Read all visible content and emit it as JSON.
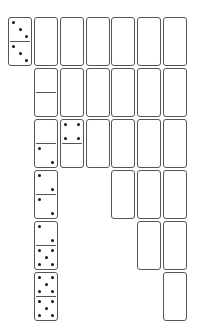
{
  "game": {
    "name": "Domino Solitaire",
    "colors": {
      "tile_border": "#555555",
      "tile_face": "#ffffff",
      "pip": "#111111",
      "background": "#ffffff"
    },
    "tile_size": {
      "width": 24,
      "height": 49
    },
    "stock": {
      "x": 8,
      "y": 17,
      "face_up": true,
      "top": 3,
      "bottom": 3
    },
    "columns": [
      {
        "x": 34,
        "tiles": [
          {
            "face_up": false
          },
          {
            "face_up": true,
            "top": 0,
            "bottom": 0
          },
          {
            "face_up": true,
            "top": 0,
            "bottom": 2
          },
          {
            "face_up": true,
            "top": 2,
            "bottom": 2
          },
          {
            "face_up": true,
            "top": 2,
            "bottom": 5
          },
          {
            "face_up": true,
            "top": 5,
            "bottom": 5
          }
        ]
      },
      {
        "x": 60,
        "tiles": [
          {
            "face_up": false
          },
          {
            "face_up": false
          },
          {
            "face_up": true,
            "top": 4,
            "bottom": 0
          }
        ]
      },
      {
        "x": 86,
        "tiles": [
          {
            "face_up": false
          },
          {
            "face_up": false
          },
          {
            "face_up": false
          }
        ]
      },
      {
        "x": 111,
        "tiles": [
          {
            "face_up": false
          },
          {
            "face_up": false
          },
          {
            "face_up": false
          },
          {
            "face_up": false
          }
        ]
      },
      {
        "x": 137,
        "tiles": [
          {
            "face_up": false
          },
          {
            "face_up": false
          },
          {
            "face_up": false
          },
          {
            "face_up": false
          },
          {
            "face_up": false
          }
        ]
      },
      {
        "x": 163,
        "tiles": [
          {
            "face_up": false
          },
          {
            "face_up": false
          },
          {
            "face_up": false
          },
          {
            "face_up": false
          },
          {
            "face_up": false
          },
          {
            "face_up": false
          }
        ]
      }
    ],
    "row_y": [
      17,
      68,
      119,
      170,
      221,
      272
    ]
  }
}
